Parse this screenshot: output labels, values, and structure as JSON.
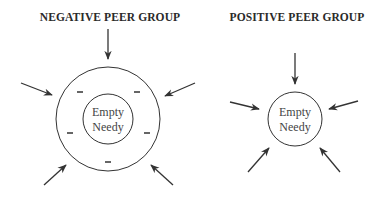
{
  "diagram": {
    "colors": {
      "stroke": "#333333",
      "text": "#2a2a2a",
      "background": "#ffffff"
    },
    "panels": [
      {
        "id": "negative",
        "title": "NEGATIVE PEER GROUP",
        "center_label_line1": "Empty",
        "center_label_line2": "Needy",
        "rings": 2,
        "ring_marks": [
          "−",
          "−",
          "−",
          "−",
          "−"
        ],
        "incoming_arrows": 5
      },
      {
        "id": "positive",
        "title": "POSITIVE PEER GROUP",
        "center_label_line1": "Empty",
        "center_label_line2": "Needy",
        "rings": 1,
        "ring_marks": [],
        "incoming_arrows": 5
      }
    ]
  }
}
